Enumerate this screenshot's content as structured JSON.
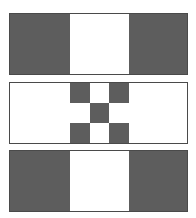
{
  "colors": {
    "dark": "#5d5d5d",
    "light": "#ffffff",
    "border": "#4a4a4a"
  },
  "bands": [
    {
      "name": "top-band",
      "pattern": [
        "dark",
        "light",
        "dark"
      ]
    },
    {
      "name": "middle-band",
      "pattern": [
        "light",
        "checker",
        "light"
      ],
      "checker": [
        [
          "dark",
          "light",
          "dark"
        ],
        [
          "light",
          "dark",
          "light"
        ],
        [
          "dark",
          "light",
          "dark"
        ]
      ]
    },
    {
      "name": "bottom-band",
      "pattern": [
        "dark",
        "light",
        "dark"
      ]
    }
  ]
}
